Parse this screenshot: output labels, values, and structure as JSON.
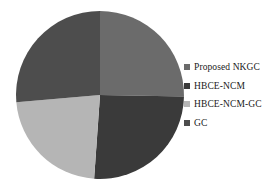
{
  "chart_data": {
    "type": "pie",
    "title": "",
    "subtitle": "",
    "xlabel": "",
    "ylabel": "",
    "grid": false,
    "legend_position": "right",
    "categories": [
      "Proposed NKGC",
      "HBCE-NCM",
      "HBCE-NCM-GC",
      "GC"
    ],
    "values": [
      25.3,
      25.8,
      22.5,
      26.4
    ],
    "slices": [
      {
        "label": "Proposed NKGC",
        "value": 25.3,
        "color": "#6b6b6b",
        "start_angle": 0,
        "end_angle": 91,
        "position": "top-right"
      },
      {
        "label": "HBCE-NCM",
        "value": 25.8,
        "color": "#3a3a3a",
        "start_angle": 91,
        "end_angle": 184,
        "position": "bottom-right"
      },
      {
        "label": "HBCE-NCM-GC",
        "value": 22.5,
        "color": "#b5b5b5",
        "start_angle": 184,
        "end_angle": 265,
        "position": "bottom-left"
      },
      {
        "label": "GC",
        "value": 26.4,
        "color": "#4d4d4d",
        "start_angle": 265,
        "end_angle": 360,
        "position": "top-left"
      }
    ]
  },
  "legend": {
    "items": [
      {
        "label": "Proposed NKGC",
        "color": "#6b6b6b",
        "marker": "square-swatch-icon"
      },
      {
        "label": "HBCE-NCM",
        "color": "#3a3a3a",
        "marker": "square-swatch-icon"
      },
      {
        "label": "HBCE-NCM-GC",
        "color": "#b5b5b5",
        "marker": "square-swatch-icon"
      },
      {
        "label": "GC",
        "color": "#4d4d4d",
        "marker": "square-swatch-icon"
      }
    ]
  },
  "geometry": {
    "center_x": 92,
    "center_y": 90,
    "radius": 84
  }
}
